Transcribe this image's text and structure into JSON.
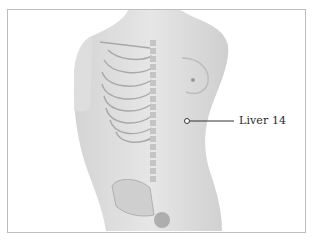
{
  "diagram": {
    "acupoint": {
      "label": "Liver 14",
      "marker_x": 187,
      "marker_y": 121
    },
    "colors": {
      "border": "#bdbdbd",
      "skin": "#dcdcdc",
      "bone": "#c8c8c8",
      "line": "#333333"
    }
  }
}
